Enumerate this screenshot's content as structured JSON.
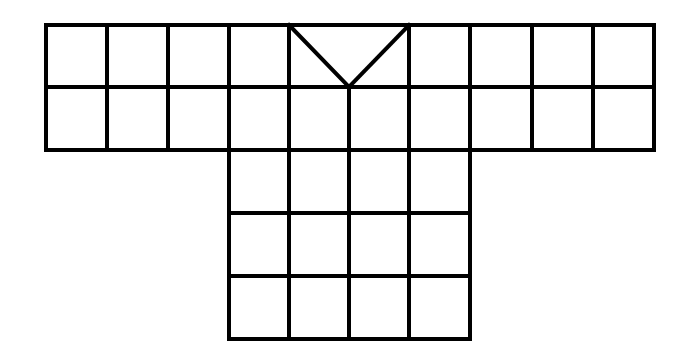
{
  "diagram": {
    "colors": {
      "background": "#ffffff",
      "stroke": "#000000"
    },
    "top_band": {
      "columns_x": [
        46,
        107,
        168,
        229,
        289,
        349,
        409,
        470,
        532,
        593,
        654
      ],
      "rows_y": [
        25,
        87,
        150
      ]
    },
    "body": {
      "columns_x": [
        229,
        289,
        349,
        409,
        470
      ],
      "rows_y": [
        150,
        213,
        276,
        339
      ]
    },
    "v_neck": {
      "left": [
        289,
        25
      ],
      "apex": [
        349,
        87
      ],
      "right": [
        409,
        25
      ]
    }
  }
}
